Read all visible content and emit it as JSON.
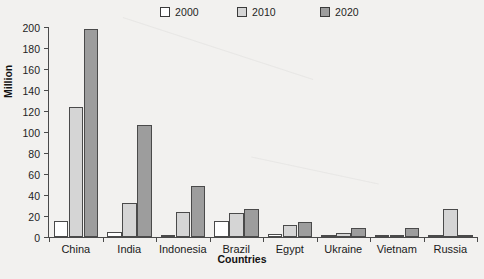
{
  "chart_data": {
    "type": "bar",
    "title": "",
    "subtitle": "",
    "xlabel": "Countries",
    "ylabel": "Million",
    "ylim": [
      0,
      200
    ],
    "ytick_step": 20,
    "yticks": [
      0,
      20,
      40,
      60,
      80,
      100,
      120,
      140,
      160,
      180,
      200
    ],
    "grid": false,
    "legend_position": "top",
    "categories": [
      "China",
      "India",
      "Indonesia",
      "Brazil",
      "Egypt",
      "Ukraine",
      "Vietnam",
      "Russia"
    ],
    "series": [
      {
        "name": "2000",
        "color": "#ffffff",
        "values": [
          15,
          5,
          0.5,
          15,
          3,
          0.3,
          0.3,
          1
        ]
      },
      {
        "name": "2010",
        "color": "#d5d5d5",
        "values": [
          124,
          32,
          24,
          23,
          11,
          4,
          2,
          27
        ]
      },
      {
        "name": "2020",
        "color": "#9d9d9d",
        "values": [
          198,
          107,
          49,
          27,
          14,
          9,
          9,
          2
        ]
      }
    ]
  },
  "legend": {
    "entries": [
      {
        "label": "2000",
        "color": "#ffffff"
      },
      {
        "label": "2010",
        "color": "#d5d5d5"
      },
      {
        "label": "2020",
        "color": "#9d9d9d"
      }
    ]
  },
  "axes": {
    "y_title": "Million",
    "x_title": "Countries",
    "y_tick_labels": [
      "200",
      "180",
      "160",
      "140",
      "120",
      "100",
      "80",
      "60",
      "40",
      "20",
      "0"
    ],
    "x_tick_labels": [
      "China",
      "India",
      "Indonesia",
      "Brazil",
      "Egypt",
      "Ukraine",
      "Vietnam",
      "Russia"
    ]
  },
  "colors": {
    "background": "#f2f1ef",
    "axis": "#4a4a4a",
    "text": "#1a1a1a",
    "series_2000": "#ffffff",
    "series_2010": "#d5d5d5",
    "series_2020": "#9d9d9d"
  }
}
